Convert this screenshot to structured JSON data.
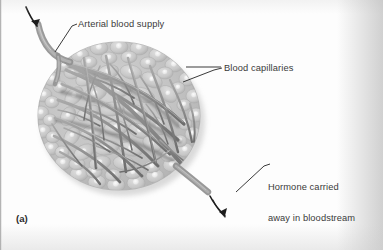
{
  "figure": {
    "letter": "(a)",
    "style": "grayscale scanned textbook illustration"
  },
  "labels": {
    "arterial": "Arterial blood supply",
    "capillaries": "Blood capillaries",
    "hormone_line1": "Hormone carried",
    "hormone_line2": "away in bloodstream"
  },
  "icons": {
    "inflow_arrow": "curved-arrow-down-right-icon",
    "outflow_arrow": "curved-arrow-down-icon",
    "leader_line": "leader-line-icon"
  },
  "colors": {
    "page_background": "#fdfdfd",
    "gland_tissue": "#c4c4c4",
    "gland_rim": "#b7b7b7",
    "cell_body": "#cdcdcd",
    "cell_nucleus": "#efefef",
    "capillary": "#8e8e8e",
    "capillary_shadow": "#6f6f6f",
    "vessel_artery": "#9a9a9a",
    "label_text": "#3a3a3a",
    "leader_line": "#2f2f2f",
    "arrow": "#1d1d1d"
  },
  "structure": {
    "gland_center_x": 119,
    "gland_center_y": 116,
    "gland_radius_x": 81,
    "gland_radius_y": 74,
    "arterial_inlet_point": "top-left",
    "venous_outlet_point": "bottom-right"
  }
}
